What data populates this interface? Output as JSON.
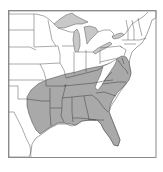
{
  "map": {
    "title": "Range map of eastern United States",
    "region": "Eastern United States",
    "shaded_range": "Southeastern United States",
    "shaded_states": [
      "Texas (east)",
      "Oklahoma (east)",
      "Arkansas",
      "Louisiana",
      "Mississippi",
      "Alabama",
      "Georgia",
      "Florida",
      "South Carolina",
      "North Carolina",
      "Tennessee",
      "Kentucky (south)",
      "Virginia",
      "West Virginia (part)",
      "Maryland",
      "Delaware",
      "Missouri (south)"
    ],
    "colors": {
      "range_fill": "#a9a9a9",
      "land_fill": "#ffffff",
      "lake_fill": "#c8c8c8",
      "border": "#555555",
      "frame": "#8a8a8a"
    }
  }
}
